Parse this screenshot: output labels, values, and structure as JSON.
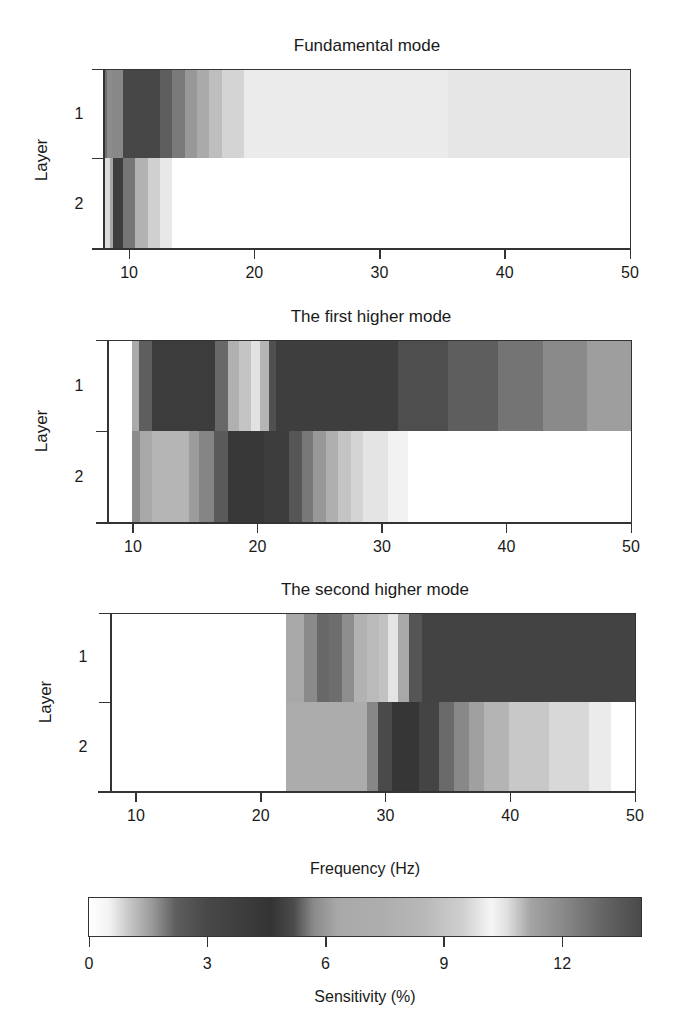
{
  "chart_data": {
    "type": "heatmap",
    "xlabel": "Frequency (Hz)",
    "ylabel": "Layer",
    "xlim": [
      8,
      50
    ],
    "xticks": [
      10,
      20,
      30,
      40,
      50
    ],
    "yticks": [
      "1",
      "2"
    ],
    "colorbar": {
      "label": "Sensitivity (%)",
      "range": [
        0,
        14
      ],
      "ticks": [
        0,
        3,
        6,
        9,
        12
      ],
      "stops": [
        [
          0,
          "#ffffff"
        ],
        [
          0.5,
          "#f4f4f4"
        ],
        [
          1.0,
          "#c8c8c8"
        ],
        [
          1.6,
          "#9a9a9a"
        ],
        [
          2.2,
          "#5e5e5e"
        ],
        [
          3.0,
          "#484848"
        ],
        [
          4.0,
          "#3c3c3c"
        ],
        [
          4.6,
          "#333333"
        ],
        [
          5.2,
          "#4c4c4c"
        ],
        [
          5.7,
          "#8a8a8a"
        ],
        [
          6.3,
          "#a8a8a8"
        ],
        [
          7.5,
          "#aeaeae"
        ],
        [
          8.5,
          "#b8b8b8"
        ],
        [
          9.5,
          "#d0d0d0"
        ],
        [
          10.2,
          "#f6f6f6"
        ],
        [
          10.6,
          "#e0e0e0"
        ],
        [
          11.2,
          "#a4a4a4"
        ],
        [
          12.0,
          "#8a8a8a"
        ],
        [
          13.0,
          "#666666"
        ],
        [
          14.0,
          "#4a4a4a"
        ]
      ]
    },
    "panels": [
      {
        "title": "Fundamental mode",
        "layers": [
          {
            "layer": "1",
            "bands": [
              [
                8.0,
                8.25,
                "#6e6e6e"
              ],
              [
                8.25,
                8.65,
                "#8c8c8c"
              ],
              [
                8.65,
                9.5,
                "#888888"
              ],
              [
                9.5,
                12.45,
                "#474747"
              ],
              [
                12.45,
                13.4,
                "#5e5e5e"
              ],
              [
                13.4,
                14.45,
                "#7a7a7a"
              ],
              [
                14.45,
                15.4,
                "#989898"
              ],
              [
                15.4,
                16.4,
                "#aaaaaa"
              ],
              [
                16.4,
                17.4,
                "#bebebe"
              ],
              [
                17.4,
                19.2,
                "#d4d4d4"
              ],
              [
                19.2,
                35.5,
                "#ebebeb"
              ],
              [
                35.5,
                50,
                "#e6e6e6"
              ]
            ]
          },
          {
            "layer": "2",
            "bands": [
              [
                8.0,
                8.45,
                "#dcdcdc"
              ],
              [
                8.45,
                8.75,
                "#a6a6a6"
              ],
              [
                8.75,
                9.55,
                "#3e3e3e"
              ],
              [
                9.55,
                10.5,
                "#767676"
              ],
              [
                10.5,
                11.5,
                "#b2b2b2"
              ],
              [
                11.5,
                12.45,
                "#d0d0d0"
              ],
              [
                12.45,
                13.4,
                "#e8e8e8"
              ],
              [
                13.4,
                50,
                "#ffffff"
              ]
            ]
          }
        ]
      },
      {
        "title": "The first higher mode",
        "layers": [
          {
            "layer": "1",
            "bands": [
              [
                8.0,
                9.9,
                "#ffffff"
              ],
              [
                9.9,
                10.5,
                "#aaaaaa"
              ],
              [
                10.5,
                11.5,
                "#5e5e5e"
              ],
              [
                11.5,
                16.6,
                "#3c3c3c"
              ],
              [
                16.6,
                17.6,
                "#686868"
              ],
              [
                17.6,
                18.5,
                "#b0b0b0"
              ],
              [
                18.5,
                19.5,
                "#c4c4c4"
              ],
              [
                19.5,
                20.2,
                "#e2e2e2"
              ],
              [
                20.2,
                20.9,
                "#b5b5b5"
              ],
              [
                20.9,
                21.5,
                "#505050"
              ],
              [
                21.5,
                31.3,
                "#3e3e3e"
              ],
              [
                31.3,
                35.3,
                "#4e4e4e"
              ],
              [
                35.3,
                39.3,
                "#5e5e5e"
              ],
              [
                39.3,
                42.9,
                "#747474"
              ],
              [
                42.9,
                46.5,
                "#8a8a8a"
              ],
              [
                46.5,
                50,
                "#9e9e9e"
              ]
            ]
          },
          {
            "layer": "2",
            "bands": [
              [
                8.0,
                9.9,
                "#ffffff"
              ],
              [
                9.9,
                10.55,
                "#8c8c8c"
              ],
              [
                10.55,
                11.5,
                "#a8a8a8"
              ],
              [
                11.5,
                14.5,
                "#b5b5b5"
              ],
              [
                14.5,
                15.3,
                "#9c9c9c"
              ],
              [
                15.3,
                16.5,
                "#858585"
              ],
              [
                16.5,
                17.6,
                "#5a5a5a"
              ],
              [
                17.6,
                20.5,
                "#383838"
              ],
              [
                20.5,
                22.5,
                "#3c3c3c"
              ],
              [
                22.5,
                23.6,
                "#565656"
              ],
              [
                23.6,
                24.5,
                "#787878"
              ],
              [
                24.5,
                25.5,
                "#989898"
              ],
              [
                25.5,
                26.5,
                "#afafaf"
              ],
              [
                26.5,
                27.5,
                "#c4c4c4"
              ],
              [
                27.5,
                28.5,
                "#d4d4d4"
              ],
              [
                28.5,
                30.5,
                "#e4e4e4"
              ],
              [
                30.5,
                32.1,
                "#f2f2f2"
              ],
              [
                32.1,
                50,
                "#ffffff"
              ]
            ]
          }
        ]
      },
      {
        "title": "The second higher mode",
        "layers": [
          {
            "layer": "1",
            "bands": [
              [
                8.0,
                22.0,
                "#ffffff"
              ],
              [
                22.0,
                23.45,
                "#a8a8a8"
              ],
              [
                23.45,
                24.5,
                "#8a8a8a"
              ],
              [
                24.5,
                25.5,
                "#686868"
              ],
              [
                25.5,
                26.5,
                "#6e6e6e"
              ],
              [
                26.5,
                27.5,
                "#8e8e8e"
              ],
              [
                27.5,
                28.5,
                "#b2b2b2"
              ],
              [
                28.5,
                29.5,
                "#bababa"
              ],
              [
                29.5,
                30.2,
                "#c2c2c2"
              ],
              [
                30.2,
                31.0,
                "#e4e4e4"
              ],
              [
                31.0,
                31.9,
                "#a8a8a8"
              ],
              [
                31.9,
                32.9,
                "#555555"
              ],
              [
                32.9,
                50,
                "#434343"
              ]
            ]
          },
          {
            "layer": "2",
            "bands": [
              [
                8.0,
                22.0,
                "#ffffff"
              ],
              [
                22.0,
                28.5,
                "#acacac"
              ],
              [
                28.5,
                29.4,
                "#878787"
              ],
              [
                29.4,
                30.5,
                "#4a4a4a"
              ],
              [
                30.5,
                32.7,
                "#363636"
              ],
              [
                32.7,
                34.3,
                "#444444"
              ],
              [
                34.3,
                35.5,
                "#6a6a6a"
              ],
              [
                35.5,
                36.7,
                "#888888"
              ],
              [
                36.7,
                37.9,
                "#a0a0a0"
              ],
              [
                37.9,
                39.9,
                "#b4b4b4"
              ],
              [
                39.9,
                43.1,
                "#c8c8c8"
              ],
              [
                43.1,
                46.3,
                "#d8d8d8"
              ],
              [
                46.3,
                48.1,
                "#ebebeb"
              ],
              [
                48.1,
                50,
                "#ffffff"
              ]
            ]
          }
        ]
      }
    ]
  },
  "labels": {
    "panel1_title": "Fundamental mode",
    "panel2_title": "The first higher mode",
    "panel3_title": "The second higher mode",
    "ylabel": "Layer",
    "layer1": "1",
    "layer2": "2",
    "xlabel": "Frequency (Hz)",
    "colorbar_label": "Sensitivity (%)",
    "xticks": [
      "10",
      "20",
      "30",
      "40",
      "50"
    ],
    "cbar_ticks": [
      "0",
      "3",
      "6",
      "9",
      "12"
    ]
  }
}
